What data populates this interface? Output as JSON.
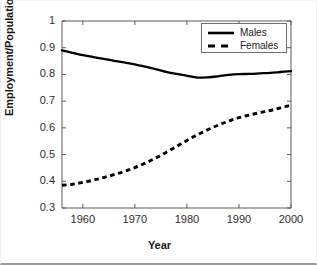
{
  "chart_data": {
    "type": "line",
    "title": "",
    "xlabel": "Year",
    "ylabel": "Employment/Population",
    "xlim": [
      1956,
      2000
    ],
    "ylim": [
      0.3,
      1.0
    ],
    "xticks": [
      1960,
      1970,
      1980,
      1990,
      2000
    ],
    "yticks": [
      "0.3",
      "0.4",
      "0.5",
      "0.6",
      "0.7",
      "0.8",
      "0.9",
      "1"
    ],
    "grid": false,
    "legend_position": "top-right",
    "x": [
      1956,
      1958,
      1960,
      1962,
      1964,
      1966,
      1968,
      1970,
      1972,
      1974,
      1976,
      1978,
      1980,
      1982,
      1984,
      1986,
      1988,
      1990,
      1992,
      1994,
      1996,
      1998,
      2000
    ],
    "series": [
      {
        "name": "Males",
        "style": "solid",
        "color": "#000000",
        "values": [
          0.89,
          0.881,
          0.872,
          0.865,
          0.858,
          0.851,
          0.845,
          0.838,
          0.829,
          0.82,
          0.81,
          0.802,
          0.795,
          0.788,
          0.789,
          0.793,
          0.798,
          0.801,
          0.802,
          0.804,
          0.806,
          0.809,
          0.812
        ]
      },
      {
        "name": "Females",
        "style": "dashed",
        "color": "#000000",
        "values": [
          0.385,
          0.389,
          0.396,
          0.404,
          0.414,
          0.425,
          0.437,
          0.451,
          0.468,
          0.487,
          0.508,
          0.53,
          0.553,
          0.574,
          0.593,
          0.61,
          0.625,
          0.638,
          0.648,
          0.657,
          0.665,
          0.675,
          0.685
        ]
      }
    ]
  },
  "legend": {
    "items": [
      {
        "label": "Males"
      },
      {
        "label": "Females"
      }
    ]
  }
}
